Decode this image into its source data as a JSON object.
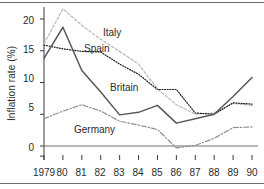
{
  "chart_data": {
    "type": "line",
    "title": "",
    "xlabel": "",
    "ylabel": "Inflation rate (%)",
    "x": [
      1979,
      1980,
      1981,
      1982,
      1983,
      1984,
      1985,
      1986,
      1987,
      1988,
      1989,
      1990
    ],
    "xtick_labels": [
      "1979",
      "80",
      "81",
      "82",
      "83",
      "84",
      "85",
      "86",
      "87",
      "88",
      "89",
      "90"
    ],
    "ytick_labels": [
      "0",
      "5",
      "10",
      "15",
      "20"
    ],
    "yticks": [
      0,
      5,
      10,
      15,
      20
    ],
    "ylim": [
      -1.5,
      22.5
    ],
    "xlim": [
      1979,
      1990
    ],
    "grid": false,
    "legend": "inline-labels",
    "series": [
      {
        "name": "Italy",
        "color": "#b8b8b8",
        "style": "dashed",
        "label_text": "Italy",
        "values": [
          16.1,
          21.6,
          19.0,
          16.8,
          14.9,
          12.9,
          9.0,
          6.5,
          5.0,
          5.2,
          6.7,
          6.4
        ]
      },
      {
        "name": "Spain",
        "color": "#1a1a1a",
        "style": "dotted",
        "label_text": "Spain",
        "values": [
          15.9,
          15.3,
          14.9,
          14.8,
          12.9,
          11.3,
          8.9,
          8.9,
          5.2,
          5.0,
          6.8,
          6.6
        ]
      },
      {
        "name": "Britain",
        "color": "#585858",
        "style": "solid",
        "label_text": "Britain",
        "values": [
          13.8,
          18.7,
          11.9,
          8.5,
          4.9,
          5.3,
          6.4,
          3.6,
          4.3,
          5.0,
          7.8,
          10.8
        ]
      },
      {
        "name": "Germany",
        "color": "#8f8f8f",
        "style": "dashdot",
        "label_text": "Germany",
        "values": [
          4.3,
          5.5,
          6.5,
          5.5,
          3.9,
          3.3,
          2.6,
          -0.3,
          0.1,
          1.2,
          2.9,
          3.0
        ]
      }
    ]
  }
}
